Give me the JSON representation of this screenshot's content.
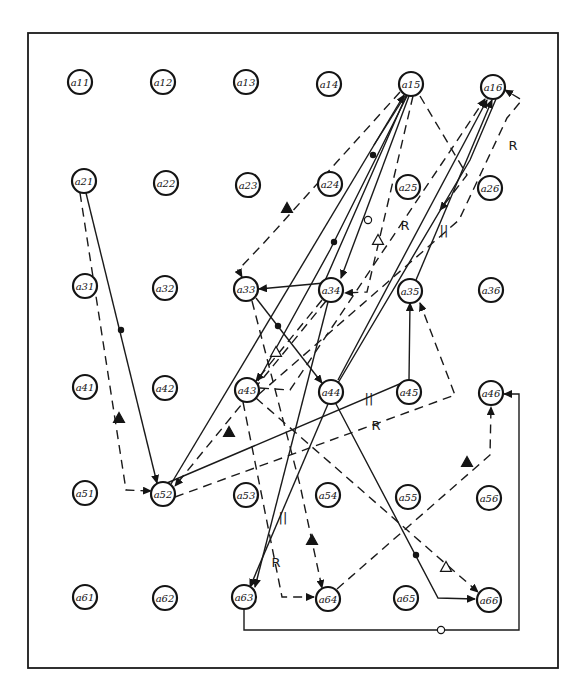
{
  "diagram": {
    "frame": {
      "x": 28,
      "y": 33,
      "width": 530,
      "height": 635
    },
    "node_radius": 12,
    "nodes": [
      {
        "id": "a11",
        "label": "a11",
        "x": 80,
        "y": 82
      },
      {
        "id": "a12",
        "label": "a12",
        "x": 163,
        "y": 82
      },
      {
        "id": "a13",
        "label": "a13",
        "x": 246,
        "y": 82
      },
      {
        "id": "a14",
        "label": "a14",
        "x": 329,
        "y": 84
      },
      {
        "id": "a15",
        "label": "a15",
        "x": 411,
        "y": 84
      },
      {
        "id": "a16",
        "label": "a16",
        "x": 493,
        "y": 87
      },
      {
        "id": "a21",
        "label": "a21",
        "x": 84,
        "y": 181
      },
      {
        "id": "a22",
        "label": "a22",
        "x": 166,
        "y": 183
      },
      {
        "id": "a23",
        "label": "a23",
        "x": 248,
        "y": 185
      },
      {
        "id": "a24",
        "label": "a24",
        "x": 330,
        "y": 184
      },
      {
        "id": "a25",
        "label": "a25",
        "x": 408,
        "y": 187
      },
      {
        "id": "a26",
        "label": "a26",
        "x": 490,
        "y": 188
      },
      {
        "id": "a31",
        "label": "a31",
        "x": 85,
        "y": 286
      },
      {
        "id": "a32",
        "label": "a32",
        "x": 165,
        "y": 288
      },
      {
        "id": "a33",
        "label": "a33",
        "x": 246,
        "y": 289
      },
      {
        "id": "a34",
        "label": "a34",
        "x": 331,
        "y": 290
      },
      {
        "id": "a35",
        "label": "a35",
        "x": 410,
        "y": 291
      },
      {
        "id": "a36",
        "label": "a36",
        "x": 491,
        "y": 290
      },
      {
        "id": "a41",
        "label": "a41",
        "x": 85,
        "y": 387
      },
      {
        "id": "a42",
        "label": "a42",
        "x": 165,
        "y": 388
      },
      {
        "id": "a43",
        "label": "a43",
        "x": 247,
        "y": 390
      },
      {
        "id": "a44",
        "label": "a44",
        "x": 331,
        "y": 392
      },
      {
        "id": "a45",
        "label": "a45",
        "x": 409,
        "y": 392
      },
      {
        "id": "a46",
        "label": "a46",
        "x": 491,
        "y": 393
      },
      {
        "id": "a51",
        "label": "a51",
        "x": 85,
        "y": 493
      },
      {
        "id": "a52",
        "label": "a52",
        "x": 163,
        "y": 494
      },
      {
        "id": "a53",
        "label": "a53",
        "x": 246,
        "y": 495
      },
      {
        "id": "a54",
        "label": "a54",
        "x": 328,
        "y": 495
      },
      {
        "id": "a55",
        "label": "a55",
        "x": 408,
        "y": 497
      },
      {
        "id": "a56",
        "label": "a56",
        "x": 489,
        "y": 498
      },
      {
        "id": "a61",
        "label": "a61",
        "x": 85,
        "y": 597
      },
      {
        "id": "a62",
        "label": "a62",
        "x": 165,
        "y": 598
      },
      {
        "id": "a63",
        "label": "a63",
        "x": 244,
        "y": 597
      },
      {
        "id": "a64",
        "label": "a64",
        "x": 328,
        "y": 599
      },
      {
        "id": "a65",
        "label": "a65",
        "x": 406,
        "y": 598
      },
      {
        "id": "a66",
        "label": "a66",
        "x": 489,
        "y": 600
      }
    ],
    "edges": [
      {
        "from": "a21",
        "to": "a52",
        "style": "solid",
        "points": [
          [
            86,
            193
          ],
          [
            157,
            483
          ]
        ],
        "arrow": true,
        "marker": {
          "type": "dot",
          "x": 121,
          "y": 330
        }
      },
      {
        "from": "a21",
        "to": "a52",
        "style": "dashed",
        "points": [
          [
            80,
            193
          ],
          [
            126,
            490
          ],
          [
            151,
            491
          ]
        ],
        "arrow": true,
        "marker": {
          "type": "tri-solid",
          "x": 119,
          "y": 418
        }
      },
      {
        "from": "a52",
        "to": "a15",
        "style": "solid",
        "points": [
          [
            171,
            484
          ],
          [
            404,
            95
          ]
        ],
        "arrow": true
      },
      {
        "from": "a15",
        "to": "a43",
        "style": "solid",
        "points": [
          [
            407,
            96
          ],
          [
            330,
            250
          ],
          [
            258,
            381
          ]
        ],
        "arrow": false
      },
      {
        "from": "a15",
        "to": "a33",
        "style": "solid",
        "points": [
          [
            406,
            96
          ],
          [
            324,
            283
          ],
          [
            259,
            289
          ]
        ],
        "arrow": true,
        "marker": {
          "type": "dot",
          "x": 334,
          "y": 242
        }
      },
      {
        "from": "a15",
        "to": "a34",
        "style": "solid",
        "points": [
          [
            409,
            96
          ],
          [
            341,
            278
          ]
        ],
        "arrow": true,
        "marker": {
          "type": "ring",
          "x": 368,
          "y": 220
        }
      },
      {
        "from": "a15",
        "to": "a34",
        "style": "dashed",
        "points": [
          [
            413,
            96
          ],
          [
            367,
            292
          ],
          [
            345,
            293
          ]
        ],
        "arrow": true,
        "marker": {
          "type": "tri",
          "x": 378,
          "y": 240
        }
      },
      {
        "from": "a15",
        "to": "a15b",
        "style": "solid",
        "points": [
          [
            405,
            96
          ],
          [
            374,
            145
          ]
        ],
        "arrow": false,
        "marker": {
          "type": "dot",
          "x": 373,
          "y": 155
        }
      },
      {
        "from": "a15",
        "to": "a33",
        "style": "dashed",
        "points": [
          [
            400,
            92
          ],
          [
            262,
            245
          ],
          [
            238,
            270
          ],
          [
            242,
            277
          ]
        ],
        "arrow": true,
        "marker": {
          "type": "tri-solid",
          "x": 287,
          "y": 208
        }
      },
      {
        "from": "a34",
        "to": "a15",
        "style": "dashed",
        "points": [
          [
            420,
            96
          ],
          [
            467,
            175
          ],
          [
            440,
            210
          ]
        ],
        "arrow": true
      },
      {
        "from": "a43",
        "to": "a16",
        "style": "dashed",
        "points": [
          [
            260,
            388
          ],
          [
            290,
            390
          ],
          [
            485,
            99
          ]
        ],
        "arrow": true,
        "label": {
          "text": "R",
          "x": 405,
          "y": 225
        }
      },
      {
        "from": "a44",
        "to": "a16",
        "style": "solid",
        "points": [
          [
            338,
            380
          ],
          [
            487,
            100
          ]
        ],
        "arrow": true
      },
      {
        "from": "a35",
        "to": "a16",
        "style": "solid",
        "points": [
          [
            416,
            280
          ],
          [
            492,
            100
          ]
        ],
        "arrow": true
      },
      {
        "from": "a43",
        "to": "a16",
        "style": "dashed",
        "points": [
          [
            258,
            395
          ],
          [
            459,
            220
          ],
          [
            507,
            118
          ],
          [
            522,
            100
          ],
          [
            505,
            90
          ]
        ],
        "arrow": true,
        "label": {
          "text": "R",
          "x": 513,
          "y": 145
        }
      },
      {
        "from": "a44",
        "to": "a16",
        "style": "solid",
        "points": [
          [
            338,
            383
          ],
          [
            470,
            160
          ],
          [
            496,
            99
          ]
        ],
        "arrow": false,
        "label": {
          "text": "||",
          "x": 444,
          "y": 230
        }
      },
      {
        "from": "a33",
        "to": "a44",
        "style": "solid",
        "points": [
          [
            256,
            298
          ],
          [
            322,
            383
          ]
        ],
        "arrow": true,
        "marker": {
          "type": "dot",
          "x": 278,
          "y": 326
        }
      },
      {
        "from": "a33",
        "to": "a64",
        "style": "dashed",
        "points": [
          [
            252,
            301
          ],
          [
            300,
            485
          ],
          [
            322,
            588
          ]
        ],
        "arrow": true,
        "marker": {
          "type": "tri-solid",
          "x": 312,
          "y": 540
        }
      },
      {
        "from": "a34",
        "to": "a43",
        "style": "dashed",
        "points": [
          [
            322,
            300
          ],
          [
            256,
            381
          ]
        ],
        "arrow": true,
        "marker": {
          "type": "tri",
          "x": 276,
          "y": 352
        }
      },
      {
        "from": "a34",
        "to": "a63",
        "style": "solid",
        "points": [
          [
            328,
            302
          ],
          [
            255,
            587
          ]
        ],
        "arrow": true
      },
      {
        "from": "a44",
        "to": "a63",
        "style": "solid",
        "points": [
          [
            328,
            404
          ],
          [
            250,
            587
          ]
        ],
        "arrow": true,
        "label": {
          "text": "||",
          "x": 283,
          "y": 517
        }
      },
      {
        "from": "a44",
        "to": "a35",
        "style": "solid",
        "points": [
          [
            167,
            483
          ],
          [
            409,
            380
          ],
          [
            410,
            303
          ]
        ],
        "arrow": true,
        "label": {
          "text": "||",
          "x": 369,
          "y": 398
        }
      },
      {
        "from": "a52",
        "to": "a35",
        "style": "dashed",
        "points": [
          [
            175,
            497
          ],
          [
            455,
            395
          ],
          [
            420,
            303
          ]
        ],
        "arrow": true,
        "label": {
          "text": "R",
          "x": 376,
          "y": 425
        }
      },
      {
        "from": "a34",
        "to": "a52",
        "style": "dashed",
        "points": [
          [
            326,
            301
          ],
          [
            175,
            486
          ]
        ],
        "arrow": true,
        "marker": {
          "type": "tri-solid",
          "x": 229,
          "y": 432
        }
      },
      {
        "from": "a43",
        "to": "a64",
        "style": "dashed",
        "points": [
          [
            243,
            402
          ],
          [
            282,
            597
          ],
          [
            314,
            597
          ]
        ],
        "arrow": true,
        "label": {
          "text": "R",
          "x": 276,
          "y": 562
        }
      },
      {
        "from": "a43",
        "to": "a66",
        "style": "dashed",
        "points": [
          [
            256,
            398
          ],
          [
            478,
            592
          ]
        ],
        "arrow": true,
        "marker": {
          "type": "tri",
          "x": 446,
          "y": 567
        }
      },
      {
        "from": "a44",
        "to": "a66",
        "style": "solid",
        "points": [
          [
            336,
            404
          ],
          [
            438,
            598
          ],
          [
            475,
            599
          ]
        ],
        "arrow": true,
        "marker": {
          "type": "dot",
          "x": 416,
          "y": 555
        }
      },
      {
        "from": "a64",
        "to": "a46",
        "style": "dashed",
        "points": [
          [
            337,
            589
          ],
          [
            490,
            455
          ],
          [
            491,
            407
          ]
        ],
        "arrow": true,
        "marker": {
          "type": "tri-solid",
          "x": 467,
          "y": 462
        }
      },
      {
        "from": "a63",
        "to": "a46",
        "style": "solid",
        "points": [
          [
            244,
            609
          ],
          [
            244,
            630
          ],
          [
            519,
            630
          ],
          [
            519,
            394
          ],
          [
            504,
            394
          ]
        ],
        "arrow": true,
        "marker": {
          "type": "ring",
          "x": 441,
          "y": 630
        }
      }
    ]
  }
}
